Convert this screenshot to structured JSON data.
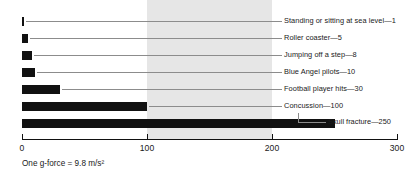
{
  "chart_data": {
    "type": "bar",
    "orientation": "horizontal",
    "title": "",
    "xlabel": "",
    "ylabel": "",
    "xlim": [
      0,
      300
    ],
    "grid": false,
    "legend": null,
    "tick_labels": [
      "0",
      "100",
      "200",
      "300"
    ],
    "tick_values": [
      0,
      100,
      200,
      300
    ],
    "categories": [
      "Standing or sitting at sea level",
      "Roller coaster",
      "Jumping off a step",
      "Blue Angel pilots",
      "Football player hits",
      "Concussion",
      "Skull fracture"
    ],
    "values": [
      1,
      5,
      8,
      10,
      30,
      100,
      250
    ],
    "labels": [
      "Standing or sitting at sea level—1",
      "Roller coaster—5",
      "Jumping off a step—8",
      "Blue Angel pilots—10",
      "Football player hits—30",
      "Concussion—100",
      "Skull fracture—250"
    ],
    "annotations": {
      "footnote": "One g-force = 9.8 m/s²",
      "shaded_band": {
        "from": 100,
        "to": 200
      }
    },
    "colors": {
      "bar": "#111111",
      "band": "#e6e6e6",
      "leader": "#8c8c8c",
      "axis": "#111111",
      "text": "#1a1a1a",
      "background": "#ffffff"
    }
  }
}
